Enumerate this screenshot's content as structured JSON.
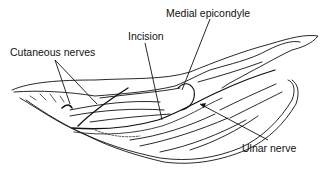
{
  "diagram": {
    "labels": {
      "medial_epicondyle": "Medial epicondyle",
      "incision": "Incision",
      "cutaneous_nerves": "Cutaneous nerves",
      "ulnar_nerve": "Ulnar nerve"
    },
    "colors": {
      "ink": "#111111",
      "background": "#ffffff"
    }
  }
}
